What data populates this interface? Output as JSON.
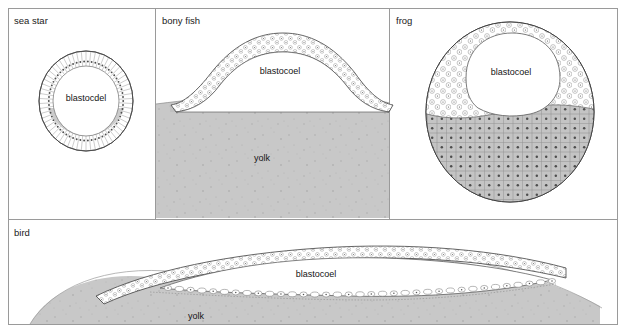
{
  "figure": {
    "width": 626,
    "height": 333,
    "background_color": "#ffffff",
    "frame_color": "#9a9a9a",
    "outline_color": "#4a4a4a",
    "yolk_color": "#c8c8c8",
    "cell_fill_color": "#c4c4c4",
    "cavity_color": "#ffffff",
    "nucleus_color": "#5a5a5a"
  },
  "panels": [
    {
      "id": "sea-star",
      "label": "sea star",
      "label_x": 14,
      "label_y": 24,
      "x": 8,
      "y": 8,
      "width": 146,
      "height": 210,
      "structures": [
        {
          "name": "blastocoel",
          "text": "blastocdel",
          "x": 86,
          "y": 98
        }
      ]
    },
    {
      "id": "bony-fish",
      "label": "bony fish",
      "label_x": 162,
      "label_y": 24,
      "x": 156,
      "y": 8,
      "width": 232,
      "height": 210,
      "structures": [
        {
          "name": "blastocoel",
          "text": "blastocoel",
          "x": 280,
          "y": 71
        },
        {
          "name": "yolk",
          "text": "yolk",
          "x": 262,
          "y": 158
        }
      ]
    },
    {
      "id": "frog",
      "label": "frog",
      "label_x": 396,
      "label_y": 24,
      "x": 390,
      "y": 8,
      "width": 228,
      "height": 210,
      "structures": [
        {
          "name": "blastocoel",
          "text": "blastocoel",
          "x": 510,
          "y": 72
        }
      ]
    },
    {
      "id": "bird",
      "label": "bird",
      "label_x": 14,
      "label_y": 236,
      "x": 8,
      "y": 220,
      "width": 610,
      "height": 105,
      "structures": [
        {
          "name": "blastocoel",
          "text": "blastocoel",
          "x": 316,
          "y": 274
        },
        {
          "name": "yolk",
          "text": "yolk",
          "x": 196,
          "y": 316
        }
      ]
    }
  ],
  "chart_data": {
    "type": "diagram",
    "categories": [
      "sea star",
      "bony fish",
      "frog",
      "bird"
    ],
    "annotations": [
      "blastocdel",
      "blastocoel",
      "yolk"
    ]
  }
}
